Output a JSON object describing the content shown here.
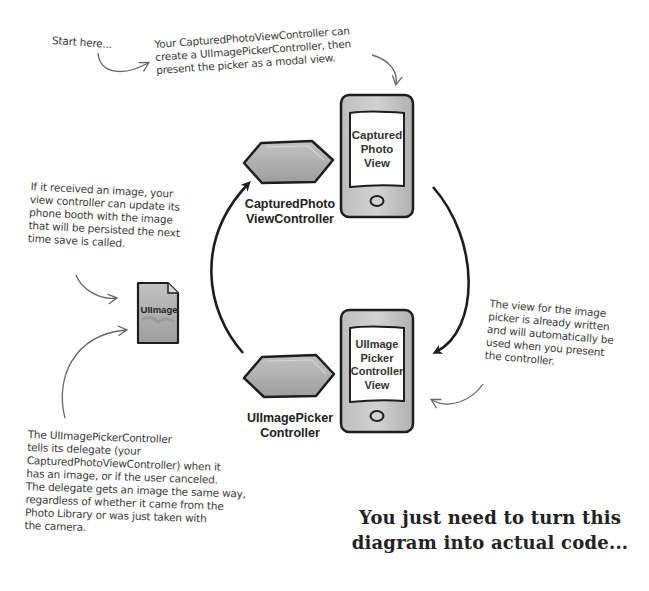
{
  "annotations": {
    "start_here": "Start here...",
    "create_picker": [
      "Your CapturedPhotoViewController can",
      "create a UIImagePickerController, then",
      "present the picker as a modal view."
    ],
    "received_image": [
      "If it received an image, your",
      "view controller can update its",
      "phone booth with the image",
      "that will be persisted the next",
      "time save is called."
    ],
    "picker_view": [
      "The view for the image",
      "picker is already written",
      "and will automatically be",
      "used when you present",
      "the controller."
    ],
    "delegate": [
      "The UIImagePickerController",
      "tells its delegate (your",
      "CapturedPhotoViewController) when it",
      "has an image, or if the user canceled.",
      "The delegate gets an image the same way,",
      "regardless of whether it came from the",
      "Photo Library or was just taken with",
      "the camera."
    ]
  },
  "nodes": {
    "captured_controller": {
      "label": [
        "CapturedPhoto",
        "ViewController"
      ],
      "icon": "hexagon-controller-icon"
    },
    "captured_view": {
      "label": [
        "Captured",
        "Photo",
        "View"
      ],
      "icon": "phone-view-icon"
    },
    "picker_controller": {
      "label": [
        "UIImagePicker",
        "Controller"
      ],
      "icon": "hexagon-controller-icon"
    },
    "picker_view": {
      "label": [
        "UIImage",
        "Picker",
        "Controller",
        "View"
      ],
      "icon": "phone-view-icon"
    },
    "uiimage": {
      "label": "UIImage",
      "icon": "document-icon"
    }
  },
  "headline": [
    "You just need to turn this",
    "diagram into actual code..."
  ],
  "colors": {
    "shape_fill": "#a9a9a9",
    "shape_fill_light": "#c4c4c4",
    "stroke": "#1e1e1e",
    "arrow_thin": "#666666",
    "text": "#333333",
    "background": "#ffffff"
  }
}
